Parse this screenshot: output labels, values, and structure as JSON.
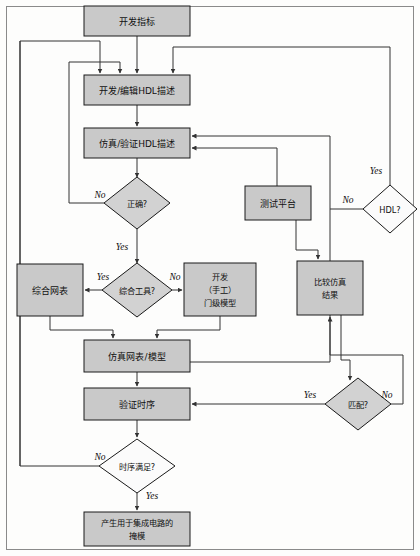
{
  "diagram": {
    "colors": {
      "process_fill": "#c9c9c9",
      "decision_fill": "#d2d2d2",
      "decision_open_fill": "#fbfbfb",
      "stroke": "#1a1a1a",
      "connector": "#333333",
      "background": "#fdfdfc"
    },
    "nodes": [
      {
        "id": "spec",
        "type": "process",
        "label": "开发指标",
        "x": 84,
        "y": 6,
        "w": 106,
        "h": 30
      },
      {
        "id": "edit_hdl",
        "type": "process",
        "label": "开发/编辑HDL描述",
        "x": 84,
        "y": 75,
        "w": 106,
        "h": 30
      },
      {
        "id": "sim_hdl",
        "type": "process",
        "label": "仿真/验证HDL描述",
        "x": 84,
        "y": 128,
        "w": 106,
        "h": 30
      },
      {
        "id": "correct",
        "type": "decision",
        "label": "正确?",
        "cx": 137,
        "cy": 203,
        "rx": 33,
        "ry": 26
      },
      {
        "id": "testbench",
        "type": "process",
        "label": "测试平台",
        "x": 245,
        "y": 186,
        "w": 66,
        "h": 34
      },
      {
        "id": "hdl_q",
        "type": "decision",
        "label": "HDL?",
        "cx": 390,
        "cy": 209,
        "rx": 27,
        "ry": 24,
        "open": true
      },
      {
        "id": "syn_netlist",
        "type": "process",
        "label": "综合网表",
        "x": 17,
        "y": 264,
        "w": 66,
        "h": 52
      },
      {
        "id": "syn_tool_q",
        "type": "decision",
        "label": "综合工具?",
        "cx": 137,
        "cy": 290,
        "rx": 35,
        "ry": 27
      },
      {
        "id": "gate_model",
        "type": "process",
        "label_lines": [
          "开发",
          "（手工）",
          "门级模型"
        ],
        "x": 184,
        "y": 263,
        "w": 72,
        "h": 53
      },
      {
        "id": "compare",
        "type": "process",
        "label_lines": [
          "比较仿真",
          "结果"
        ],
        "x": 297,
        "y": 261,
        "w": 66,
        "h": 54
      },
      {
        "id": "sim_netlist",
        "type": "process",
        "label": "仿真网表/模型",
        "x": 84,
        "y": 340,
        "w": 106,
        "h": 32
      },
      {
        "id": "verify_time",
        "type": "process",
        "label": "验证时序",
        "x": 84,
        "y": 388,
        "w": 106,
        "h": 32
      },
      {
        "id": "match_q",
        "type": "decision",
        "label": "匹配?",
        "cx": 358,
        "cy": 404,
        "rx": 33,
        "ry": 26
      },
      {
        "id": "timing_q",
        "type": "decision",
        "label": "时序满足?",
        "cx": 137,
        "cy": 466,
        "rx": 38,
        "ry": 27,
        "open": true
      },
      {
        "id": "mask",
        "type": "process",
        "label_lines": [
          "产生用于集成电路的",
          "掩模"
        ],
        "x": 84,
        "y": 512,
        "w": 106,
        "h": 34
      }
    ],
    "edge_labels": [
      {
        "id": "correct_no",
        "text": "No",
        "x": 100,
        "y": 196
      },
      {
        "id": "correct_yes",
        "text": "Yes",
        "x": 122,
        "y": 248
      },
      {
        "id": "syn_yes",
        "text": "Yes",
        "x": 103,
        "y": 278
      },
      {
        "id": "syn_no",
        "text": "No",
        "x": 173,
        "y": 278
      },
      {
        "id": "hdl_yes",
        "text": "Yes",
        "x": 376,
        "y": 172
      },
      {
        "id": "hdl_no",
        "text": "No",
        "x": 348,
        "y": 201
      },
      {
        "id": "match_yes",
        "text": "Yes",
        "x": 310,
        "y": 396
      },
      {
        "id": "match_no",
        "text": "No",
        "x": 387,
        "y": 396
      },
      {
        "id": "timing_no",
        "text": "No",
        "x": 100,
        "y": 458
      },
      {
        "id": "timing_yes",
        "text": "Yes",
        "x": 152,
        "y": 497
      }
    ]
  }
}
